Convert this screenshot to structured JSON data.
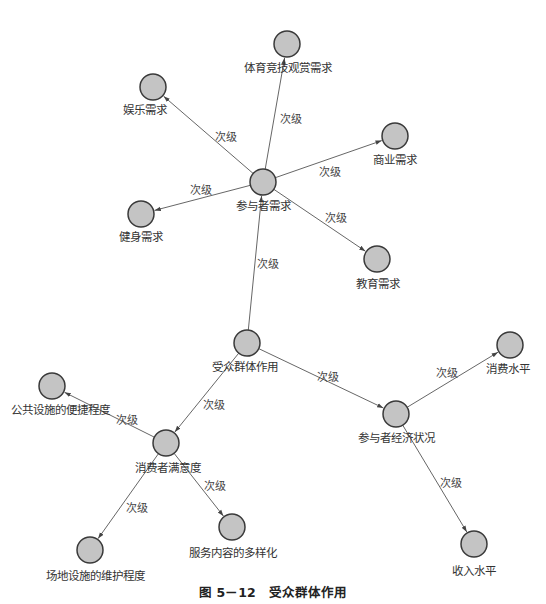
{
  "diagram": {
    "type": "network-graph",
    "caption": "图 5－12　受众群体作用",
    "edge_label_default": "次级",
    "nodes": [
      {
        "id": "audience",
        "label": "受众群体作用",
        "x": 247,
        "y": 343
      },
      {
        "id": "participant_demand",
        "label": "参与者需求",
        "x": 263,
        "y": 182
      },
      {
        "id": "sports_viewing",
        "label": "体育竞技观赏需求",
        "x": 287,
        "y": 44
      },
      {
        "id": "entertainment",
        "label": "娱乐需求",
        "x": 153,
        "y": 87
      },
      {
        "id": "commercial",
        "label": "商业需求",
        "x": 395,
        "y": 136
      },
      {
        "id": "fitness",
        "label": "健身需求",
        "x": 141,
        "y": 214
      },
      {
        "id": "education",
        "label": "教育需求",
        "x": 377,
        "y": 259
      },
      {
        "id": "economic_status",
        "label": "参与者经济状况",
        "x": 396,
        "y": 414
      },
      {
        "id": "consumption_level",
        "label": "消费水平",
        "x": 510,
        "y": 345
      },
      {
        "id": "income_level",
        "label": "收入水平",
        "x": 474,
        "y": 544
      },
      {
        "id": "satisfaction",
        "label": "消费者满意度",
        "x": 166,
        "y": 443
      },
      {
        "id": "public_facility",
        "label": "公共设施的便捷程度",
        "x": 52,
        "y": 386
      },
      {
        "id": "venue_maintenance",
        "label": "场地设施的维护程度",
        "x": 90,
        "y": 550
      },
      {
        "id": "service_diversity",
        "label": "服务内容的多样化",
        "x": 232,
        "y": 527
      }
    ],
    "node_labels_pos": [
      {
        "x": 245,
        "y": 371
      },
      {
        "x": 263,
        "y": 210
      },
      {
        "x": 288,
        "y": 72
      },
      {
        "x": 145,
        "y": 114
      },
      {
        "x": 395,
        "y": 164
      },
      {
        "x": 141,
        "y": 241
      },
      {
        "x": 378,
        "y": 288
      },
      {
        "x": 396,
        "y": 442
      },
      {
        "x": 508,
        "y": 373
      },
      {
        "x": 474,
        "y": 575
      },
      {
        "x": 168,
        "y": 472
      },
      {
        "x": 60,
        "y": 414
      },
      {
        "x": 95,
        "y": 580
      },
      {
        "x": 233,
        "y": 557
      }
    ],
    "edges": [
      {
        "from": "audience",
        "to": "participant_demand",
        "label": "次级",
        "lx": 268,
        "ly": 268
      },
      {
        "from": "participant_demand",
        "to": "sports_viewing",
        "label": "次级",
        "lx": 291,
        "ly": 123
      },
      {
        "from": "participant_demand",
        "to": "entertainment",
        "label": "次级",
        "lx": 226,
        "ly": 141
      },
      {
        "from": "participant_demand",
        "to": "commercial",
        "label": "次级",
        "lx": 330,
        "ly": 176
      },
      {
        "from": "participant_demand",
        "to": "fitness",
        "label": "次级",
        "lx": 201,
        "ly": 194
      },
      {
        "from": "participant_demand",
        "to": "education",
        "label": "次级",
        "lx": 336,
        "ly": 222
      },
      {
        "from": "audience",
        "to": "economic_status",
        "label": "次级",
        "lx": 328,
        "ly": 381
      },
      {
        "from": "economic_status",
        "to": "consumption_level",
        "label": "次级",
        "lx": 447,
        "ly": 377
      },
      {
        "from": "economic_status",
        "to": "income_level",
        "label": "次级",
        "lx": 451,
        "ly": 487
      },
      {
        "from": "audience",
        "to": "satisfaction",
        "label": "次级",
        "lx": 214,
        "ly": 409
      },
      {
        "from": "satisfaction",
        "to": "public_facility",
        "label": "次级",
        "lx": 127,
        "ly": 424
      },
      {
        "from": "satisfaction",
        "to": "venue_maintenance",
        "label": "次级",
        "lx": 137,
        "ly": 512
      },
      {
        "from": "satisfaction",
        "to": "service_diversity",
        "label": "次级",
        "lx": 215,
        "ly": 490
      }
    ],
    "colors": {
      "node_fill": "#c4c4c4",
      "node_stroke": "#3a3a3a",
      "edge": "#555555",
      "background": "#ffffff"
    }
  }
}
